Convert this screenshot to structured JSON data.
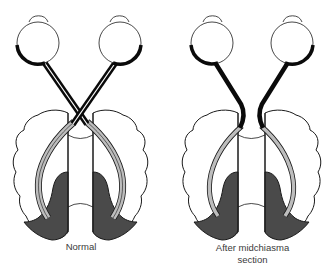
{
  "figure": {
    "panels": [
      {
        "id": "normal",
        "caption": "Normal",
        "optic_chiasm": "intact (nerves cross)"
      },
      {
        "id": "after-midchiasma-section",
        "caption_line1": "After midchiasma",
        "caption_line2": "section",
        "optic_chiasm": "sectioned (nerves do not cross)"
      }
    ],
    "colors": {
      "outline": "#1a1a1a",
      "nerve": "#0a0a0a",
      "radiation": "#bdbdbd",
      "visual_cortex": "#4a4a4a",
      "background": "#ffffff"
    }
  }
}
